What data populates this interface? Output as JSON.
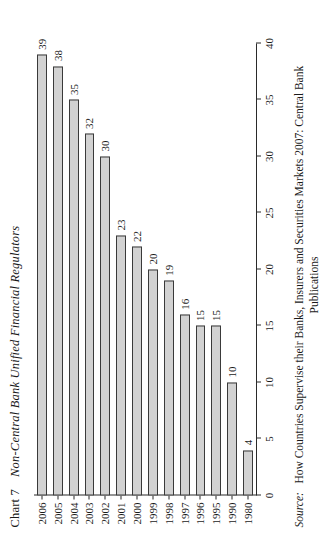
{
  "chart_data": {
    "type": "bar",
    "orientation": "horizontal",
    "chart_number_label": "Chart 7",
    "chart_title_text": "Non-Central Bank Unified Financial Regulators",
    "categories": [
      "1980",
      "1990",
      "1995",
      "1996",
      "1997",
      "1998",
      "1999",
      "2000",
      "2001",
      "2002",
      "2003",
      "2004",
      "2005",
      "2006"
    ],
    "values": [
      4,
      10,
      15,
      15,
      16,
      19,
      20,
      22,
      23,
      30,
      32,
      35,
      38,
      39
    ],
    "data_labels": [
      "4",
      "10",
      "15",
      "15",
      "16",
      "19",
      "20",
      "22",
      "23",
      "30",
      "32",
      "35",
      "38",
      "39"
    ],
    "xlabel": "",
    "ylabel": "",
    "xlim": [
      0,
      40
    ],
    "xticks": [
      0,
      5,
      10,
      15,
      20,
      25,
      30,
      35,
      40
    ],
    "xtick_labels": [
      "0",
      "5",
      "10",
      "15",
      "20",
      "25",
      "30",
      "35",
      "40"
    ],
    "grid": false,
    "legend": null,
    "bar_fill_color": "#d2d2d2",
    "bar_border_color": "#3a3a3a",
    "axis_color": "#2a2a2a",
    "text_color": "#1a1a1a"
  },
  "source": {
    "label": "Source:",
    "text": "How Countries Supervise their Banks, Insurers and Securities Markets 2007: Central Bank",
    "second_line": "Publications"
  }
}
